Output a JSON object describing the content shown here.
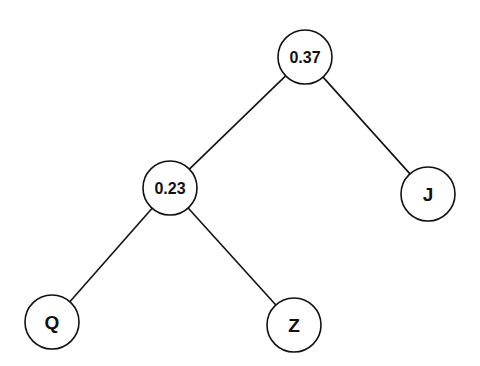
{
  "diagram": {
    "type": "dendrogram-tree",
    "nodes": [
      {
        "id": "root",
        "label": "0.37",
        "cx": 305,
        "cy": 57,
        "r": 27,
        "font_size": 16
      },
      {
        "id": "inner",
        "label": "0.23",
        "cx": 170,
        "cy": 188,
        "r": 27,
        "font_size": 16
      },
      {
        "id": "J",
        "label": "J",
        "cx": 428,
        "cy": 194,
        "r": 27,
        "font_size": 19
      },
      {
        "id": "Q",
        "label": "Q",
        "cx": 52,
        "cy": 322,
        "r": 27,
        "font_size": 19
      },
      {
        "id": "Z",
        "label": "Z",
        "cx": 294,
        "cy": 325,
        "r": 27,
        "font_size": 19
      }
    ],
    "edges": [
      {
        "from": "root",
        "to": "inner"
      },
      {
        "from": "root",
        "to": "J"
      },
      {
        "from": "inner",
        "to": "Q"
      },
      {
        "from": "inner",
        "to": "Z"
      }
    ],
    "colors": {
      "stroke": "#111111",
      "fill": "#ffffff",
      "text": "#111111"
    }
  }
}
